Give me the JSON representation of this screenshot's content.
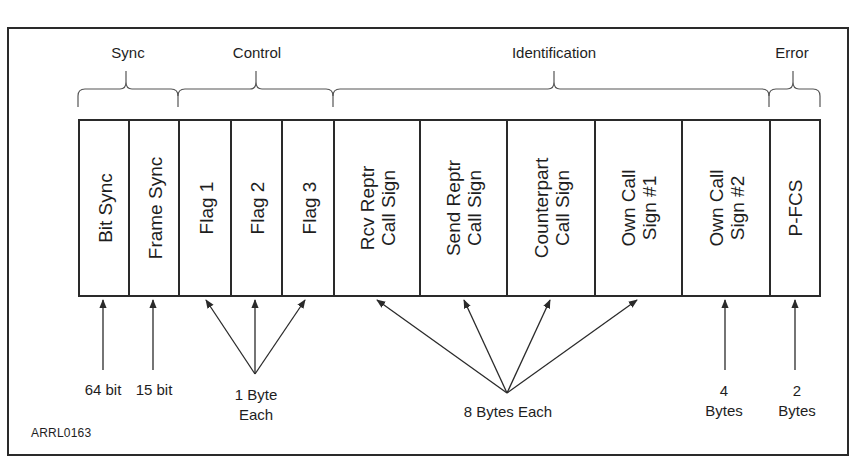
{
  "diagram": {
    "figure_id": "ARRL0163",
    "groups": [
      {
        "label": "Sync",
        "x_start": 78,
        "x_end": 178
      },
      {
        "label": "Control",
        "x_start": 178,
        "x_end": 333
      },
      {
        "label": "Identification",
        "x_start": 333,
        "x_end": 769
      },
      {
        "label": "Error",
        "x_start": 769,
        "x_end": 820
      }
    ],
    "fields": [
      {
        "label": "Bit Sync",
        "group": "Sync",
        "x": 78,
        "w": 50
      },
      {
        "label": "Frame Sync",
        "group": "Sync",
        "x": 128,
        "w": 50
      },
      {
        "label": "Flag 1",
        "group": "Control",
        "x": 178,
        "w": 52
      },
      {
        "label": "Flag 2",
        "group": "Control",
        "x": 230,
        "w": 51
      },
      {
        "label": "Flag 3",
        "group": "Control",
        "x": 281,
        "w": 52
      },
      {
        "label": "Rcv Reptr\nCall Sign",
        "group": "Identification",
        "x": 333,
        "w": 86
      },
      {
        "label": "Send Reptr\nCall Sign",
        "group": "Identification",
        "x": 419,
        "w": 87
      },
      {
        "label": "Counterpart\nCall Sign",
        "group": "Identification",
        "x": 506,
        "w": 88
      },
      {
        "label": "Own Call\nSign #1",
        "group": "Identification",
        "x": 594,
        "w": 87
      },
      {
        "label": "Own Call\nSign #2",
        "group": "Identification",
        "x": 681,
        "w": 88
      },
      {
        "label": "P-FCS",
        "group": "Error",
        "x": 769,
        "w": 51
      }
    ],
    "sizes": [
      {
        "label": "64 bit",
        "applies_to": [
          "Bit Sync"
        ],
        "x": 103,
        "y": 381
      },
      {
        "label": "15 bit",
        "applies_to": [
          "Frame Sync"
        ],
        "x": 153,
        "y": 381
      },
      {
        "label": "1 Byte\nEach",
        "applies_to": [
          "Flag 1",
          "Flag 2",
          "Flag 3"
        ],
        "x": 256,
        "y": 385
      },
      {
        "label": "8 Bytes Each",
        "applies_to": [
          "Rcv Reptr Call Sign",
          "Send Reptr Call Sign",
          "Counterpart Call Sign",
          "Own Call Sign #1"
        ],
        "x": 508,
        "y": 403
      },
      {
        "label": "4\nBytes",
        "applies_to": [
          "Own Call Sign #2"
        ],
        "x": 724,
        "y": 381
      },
      {
        "label": "2\nBytes",
        "applies_to": [
          "P-FCS"
        ],
        "x": 797,
        "y": 381
      }
    ],
    "colors": {
      "line": "#2a2a2a",
      "background": "#ffffff",
      "text": "#1e1e1e"
    }
  }
}
